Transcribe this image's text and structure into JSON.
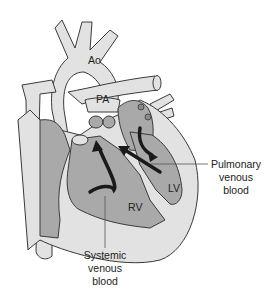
{
  "diagram": {
    "colors": {
      "vessel_fill": "#e2e2e2",
      "chamber_fill": "#a9a9a9",
      "outline": "#3a3a3a",
      "arrow": "#1a1a1a",
      "background": "#ffffff"
    },
    "labels": {
      "aorta": "Ao",
      "pulmonary_artery": "PA",
      "right_ventricle": "RV",
      "left_ventricle": "LV",
      "pulmonary_venous": [
        "Pulmonary",
        "venous",
        "blood"
      ],
      "systemic_venous": [
        "Systemic",
        "venous",
        "blood"
      ]
    }
  }
}
